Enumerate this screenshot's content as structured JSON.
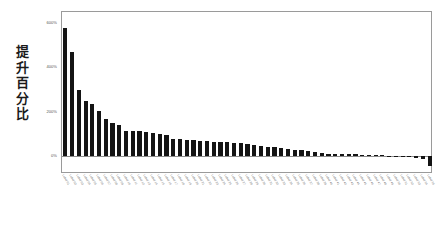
{
  "chart_data": {
    "type": "bar",
    "title": "",
    "subtitle": "",
    "xlabel": "",
    "ylabel": "提升百分比",
    "ylabel_chars": [
      "提",
      "升",
      "百",
      "分",
      "比"
    ],
    "ylim": [
      -80,
      650
    ],
    "ytick_values": [
      0,
      200,
      400,
      600
    ],
    "ytick_labels": [
      "0%",
      "200%",
      "400%",
      "600%"
    ],
    "grid": false,
    "legend": false,
    "zero_line": true,
    "bar_color": "#141414",
    "frame_color": "#9a9a9a",
    "value_unit": "%",
    "categories": [
      "Label 01",
      "Label 02",
      "Label 03",
      "Label 04",
      "Label 05",
      "Label 06",
      "Label 07",
      "Label 08",
      "Label 09",
      "Label 10",
      "Label 11",
      "Label 12",
      "Label 13",
      "Label 14",
      "Label 15",
      "Label 16",
      "Label 17",
      "Label 18",
      "Label 19",
      "Label 20",
      "Label 21",
      "Label 22",
      "Label 23",
      "Label 24",
      "Label 25",
      "Label 26",
      "Label 27",
      "Label 28",
      "Label 29",
      "Label 30",
      "Label 31",
      "Label 32",
      "Label 33",
      "Label 34",
      "Label 35",
      "Label 36",
      "Label 37",
      "Label 38",
      "Label 39",
      "Label 40",
      "Label 41",
      "Label 42",
      "Label 43",
      "Label 44",
      "Label 45",
      "Label 46",
      "Label 47",
      "Label 48",
      "Label 49",
      "Label 50",
      "Label 51",
      "Label 52",
      "Label 53",
      "Label 54",
      "Label 55"
    ],
    "values": [
      580,
      470,
      300,
      250,
      235,
      205,
      170,
      152,
      142,
      115,
      113,
      112,
      110,
      104,
      100,
      96,
      78,
      76,
      74,
      72,
      70,
      68,
      66,
      64,
      62,
      60,
      58,
      56,
      50,
      46,
      42,
      40,
      38,
      34,
      30,
      26,
      22,
      18,
      14,
      12,
      11,
      10,
      9,
      8,
      7,
      6,
      5,
      4,
      3,
      2,
      1,
      -4,
      -10,
      -13,
      -42
    ]
  }
}
